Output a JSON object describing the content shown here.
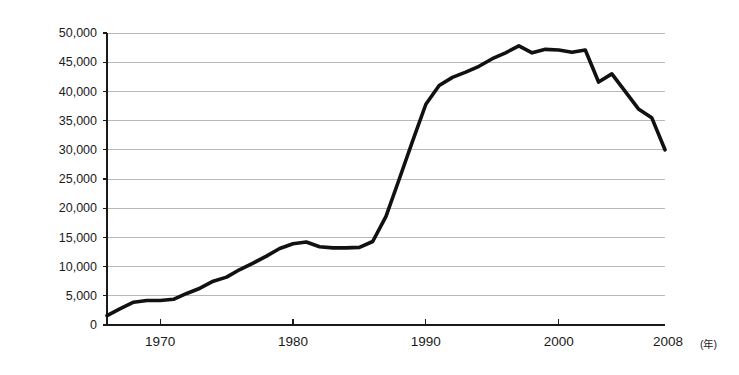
{
  "chart_data": {
    "type": "line",
    "title": "",
    "subtitle": "",
    "xlabel": "",
    "ylabel": "",
    "xunit": "(年)",
    "xlim": [
      1966,
      2008
    ],
    "ylim": [
      0,
      50000
    ],
    "grid": true,
    "legend": false,
    "legend_position": "none",
    "y_ticks": [
      0,
      5000,
      10000,
      15000,
      20000,
      25000,
      30000,
      35000,
      40000,
      45000,
      50000
    ],
    "y_tick_labels": [
      "0",
      "5,000",
      "10,000",
      "15,000",
      "20,000",
      "25,000",
      "30,000",
      "35,000",
      "40,000",
      "45,000",
      "50,000"
    ],
    "x_ticks": [
      1970,
      1980,
      1990,
      2000
    ],
    "x_tick_labels": [
      "1970",
      "1980",
      "1990",
      "2000"
    ],
    "x_end_label": "2008",
    "x": [
      1966,
      1967,
      1968,
      1969,
      1970,
      1971,
      1972,
      1973,
      1974,
      1975,
      1976,
      1977,
      1978,
      1979,
      1980,
      1981,
      1982,
      1983,
      1984,
      1985,
      1986,
      1987,
      1988,
      1989,
      1990,
      1991,
      1992,
      1993,
      1994,
      1995,
      1996,
      1997,
      1998,
      1999,
      2000,
      2001,
      2002,
      2003,
      2004,
      2005,
      2006,
      2007,
      2008
    ],
    "series": [
      {
        "name": "value",
        "values": [
          1600,
          2800,
          3900,
          4200,
          4200,
          4400,
          5400,
          6300,
          7500,
          8200,
          9500,
          10600,
          11800,
          13100,
          13900,
          14200,
          13400,
          13200,
          13200,
          13300,
          14300,
          18600,
          25000,
          31500,
          37800,
          41000,
          42400,
          43300,
          44300,
          45600,
          46600,
          47800,
          46600,
          47200,
          47100,
          46700,
          47100,
          41600,
          43000,
          40000,
          37000,
          35500,
          30000
        ]
      }
    ]
  }
}
